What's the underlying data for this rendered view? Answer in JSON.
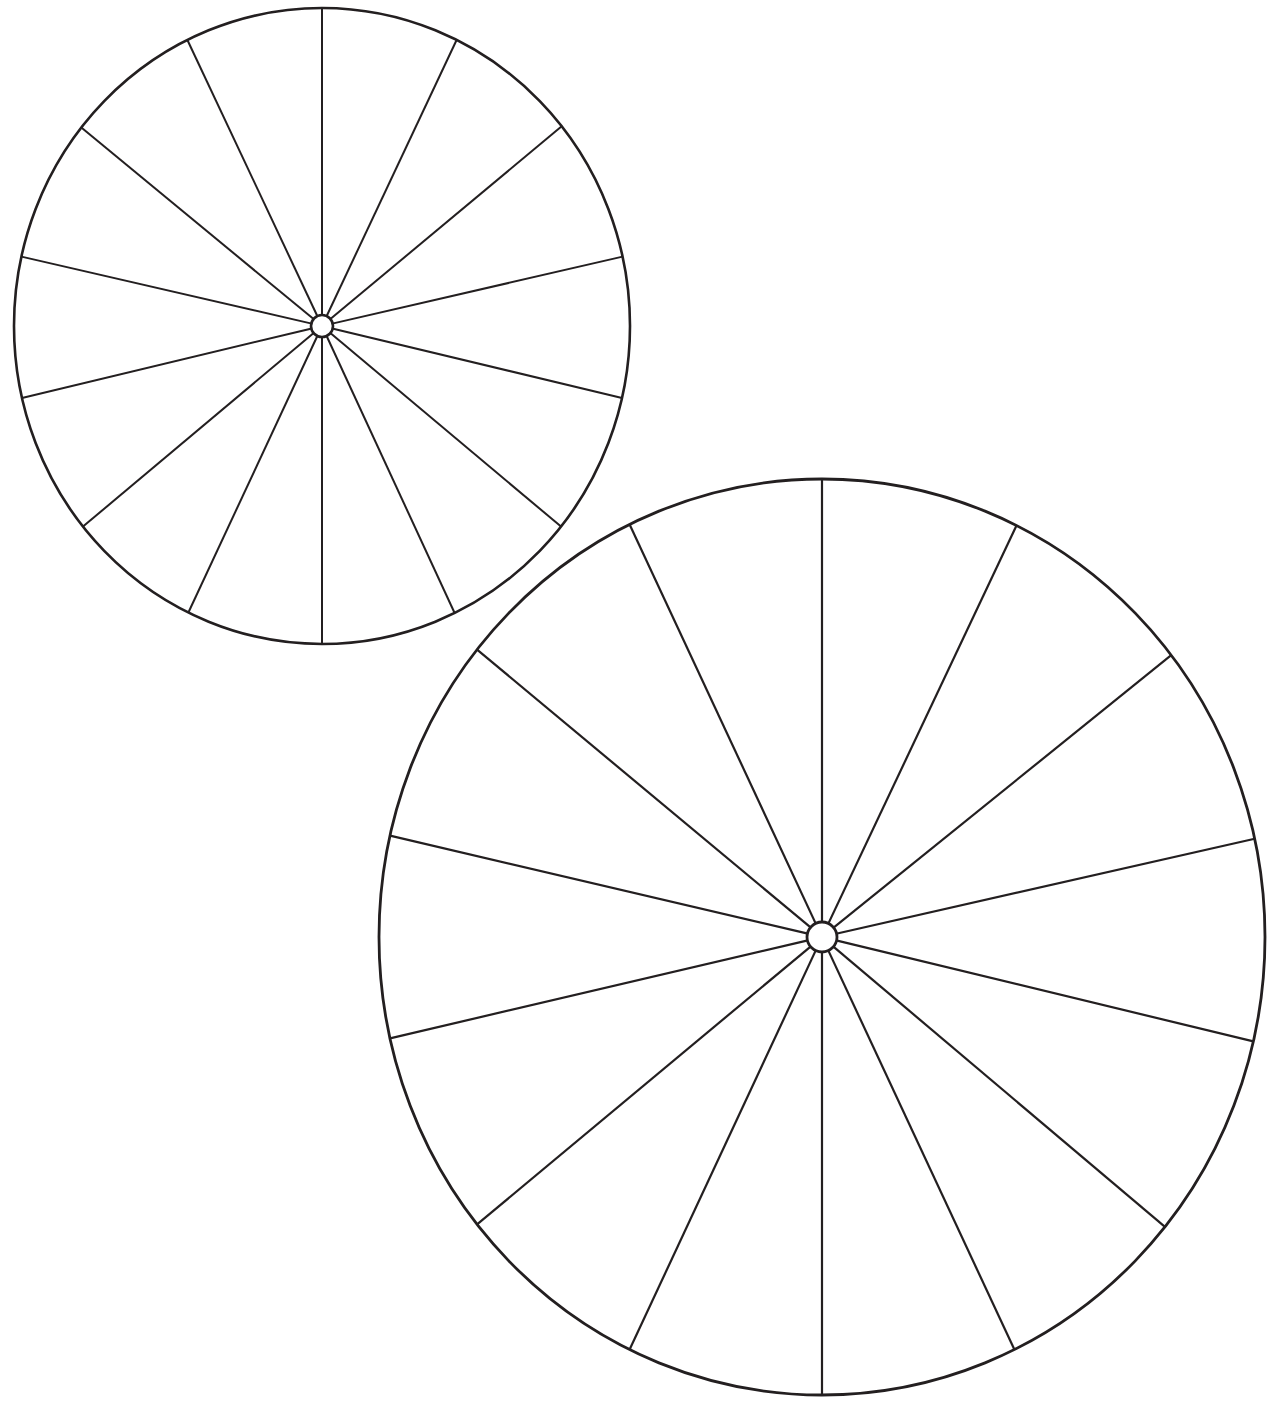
{
  "page": {
    "title": "Two spoked wheel diagrams",
    "width": 1273,
    "height": 1404,
    "background_color": "#ffffff",
    "line_color": "#231f20"
  },
  "figure": {
    "type": "line-drawing",
    "shape_count": 2,
    "shapes": [
      {
        "name": "small-wheel",
        "label": "Upper-left wheel",
        "center_x": 322,
        "center_y": 326,
        "radius_x": 308,
        "radius_y": 318,
        "hub_radius": 11,
        "rim_stroke_width": 2.6,
        "spoke_stroke_width": 2.0,
        "hub_stroke_width": 2.6,
        "spoke_count": 14,
        "spoke_angles_deg": [
          90,
          64.8,
          39.8,
          13.0,
          -13.5,
          -40.0,
          -65.2,
          -90,
          -115.0,
          -140.0,
          -166.5,
          167.0,
          140.5,
          115.2
        ]
      },
      {
        "name": "large-wheel",
        "label": "Lower-right wheel",
        "center_x": 822,
        "center_y": 937,
        "radius_x": 443,
        "radius_y": 458,
        "hub_radius": 15,
        "rim_stroke_width": 2.8,
        "spoke_stroke_width": 2.2,
        "hub_stroke_width": 2.8,
        "spoke_count": 14,
        "spoke_angles_deg": [
          90,
          64.7,
          38.9,
          12.8,
          -13.6,
          -40.2,
          -65.0,
          -90,
          -115.0,
          -140.2,
          -166.8,
          166.8,
          140.2,
          115.0
        ]
      }
    ]
  },
  "chart_data": {
    "type": "pie",
    "title": "",
    "xlabel": "",
    "ylabel": "",
    "legend": [],
    "note": "Two blank pie/rosette templates: each divided into 14 sectors by spokes, no labels or values shown.",
    "charts": [
      {
        "name": "small-wheel",
        "sector_count": 14,
        "sector_angles_deg": [
          25.2,
          25.0,
          26.8,
          26.5,
          26.5,
          25.2,
          25.2,
          25.0,
          25.0,
          26.5,
          26.5,
          26.5,
          25.3,
          25.2
        ],
        "values": [],
        "categories": []
      },
      {
        "name": "large-wheel",
        "sector_count": 14,
        "sector_angles_deg": [
          25.3,
          25.8,
          26.1,
          26.4,
          26.6,
          24.8,
          25.0,
          25.0,
          25.2,
          26.6,
          26.4,
          26.6,
          25.9,
          25.3
        ],
        "values": [],
        "categories": []
      }
    ]
  }
}
